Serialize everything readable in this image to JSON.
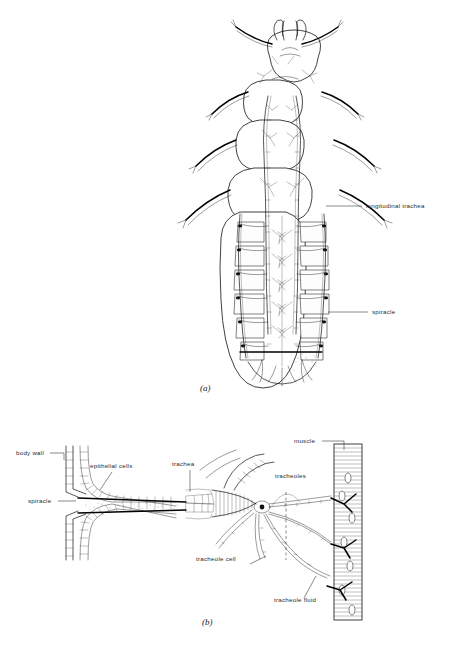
{
  "figure": {
    "panels": [
      {
        "id": "a",
        "caption": "(a)",
        "description": "Dorsal view of an insect larva showing the tracheal system",
        "labels": [
          {
            "name": "longitudinal-trachea",
            "text": "longitudinal trachea",
            "x": 366,
            "y": 208
          },
          {
            "name": "spiracle",
            "text": "spiracle",
            "x": 372,
            "y": 314
          }
        ]
      },
      {
        "id": "b",
        "caption": "(b)",
        "description": "Detail of a spiracle, trachea and tracheoles supplying a muscle",
        "labels": [
          {
            "name": "body-wall",
            "text": "body wall",
            "x": 16,
            "y": 455
          },
          {
            "name": "epithelial-cells",
            "text": "epithelial cells",
            "x": 90,
            "y": 468
          },
          {
            "name": "trachea",
            "text": "trachea",
            "x": 172,
            "y": 466
          },
          {
            "name": "spiracle",
            "text": "spiracle",
            "x": 28,
            "y": 503
          },
          {
            "name": "muscle",
            "text": "muscle",
            "x": 294,
            "y": 443
          },
          {
            "name": "tracheoles",
            "text": "tracheoles",
            "x": 275,
            "y": 478
          },
          {
            "name": "tracheole-cell",
            "text": "tracheole cell",
            "x": 196,
            "y": 561
          },
          {
            "name": "tracheole-fluid",
            "text": "tracheole fluid",
            "x": 274,
            "y": 602
          }
        ]
      }
    ]
  },
  "colors": {
    "background": "#ffffff",
    "ink": "#111111",
    "label": "#2a2a2a"
  }
}
